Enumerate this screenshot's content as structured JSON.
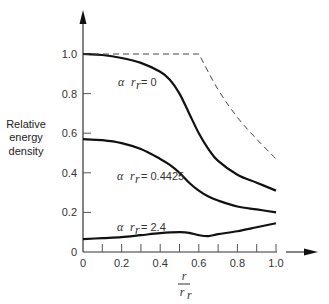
{
  "chart_data": {
    "type": "line",
    "title": "",
    "xlabel": "r / r_r",
    "ylabel": "Relative energy density",
    "xlim": [
      0,
      1.0
    ],
    "ylim": [
      0,
      1.0
    ],
    "grid": false,
    "legend": "inline curve labels",
    "x_ticks": [
      "0",
      "0.2",
      "0.4",
      "0.6",
      "0.8",
      "1.0"
    ],
    "y_ticks": [
      "0",
      "0.2",
      "0.4",
      "0.6",
      "0.8",
      "1.0"
    ],
    "x_minor_tick_step": 0.1,
    "series": [
      {
        "name": "α r_r = 0",
        "style": "solid",
        "x": [
          0,
          0.1,
          0.2,
          0.3,
          0.4,
          0.45,
          0.5,
          0.55,
          0.6,
          0.65,
          0.7,
          0.8,
          0.9,
          1.0
        ],
        "y": [
          1.0,
          0.995,
          0.98,
          0.955,
          0.91,
          0.87,
          0.8,
          0.7,
          0.6,
          0.52,
          0.46,
          0.39,
          0.35,
          0.31
        ]
      },
      {
        "name": "α r_r = 0.4425",
        "style": "solid",
        "x": [
          0,
          0.1,
          0.2,
          0.3,
          0.4,
          0.45,
          0.5,
          0.55,
          0.6,
          0.65,
          0.7,
          0.8,
          0.9,
          1.0
        ],
        "y": [
          0.57,
          0.565,
          0.55,
          0.52,
          0.47,
          0.44,
          0.4,
          0.35,
          0.31,
          0.28,
          0.26,
          0.23,
          0.215,
          0.2
        ]
      },
      {
        "name": "α r_r = 2.4",
        "style": "solid",
        "x": [
          0,
          0.1,
          0.2,
          0.3,
          0.4,
          0.5,
          0.55,
          0.6,
          0.65,
          0.7,
          0.8,
          0.9,
          1.0
        ],
        "y": [
          0.065,
          0.07,
          0.075,
          0.085,
          0.095,
          0.1,
          0.097,
          0.085,
          0.08,
          0.09,
          0.105,
          0.125,
          0.145
        ]
      },
      {
        "name": "limit",
        "style": "dashed",
        "x": [
          0,
          0.6,
          0.7,
          0.8,
          0.9,
          1.0
        ],
        "y": [
          1.0,
          1.0,
          0.82,
          0.68,
          0.57,
          0.47
        ]
      }
    ],
    "annotations": [
      "α r_r = 0",
      "α r_r = 0.4425",
      "α r_r = 2.4"
    ]
  },
  "labels": {
    "ylabel_lines": [
      "Relative",
      "energy",
      "density"
    ],
    "xlabel_num": "r",
    "xlabel_den": "r",
    "xlabel_den_sub": "r",
    "curve0": {
      "alpha": "α",
      "r": "r",
      "sub": "r",
      "eq": "= 0"
    },
    "curve1": {
      "alpha": "α",
      "r": "r",
      "sub": "r",
      "eq": "= 0.4425"
    },
    "curve2": {
      "alpha": "α",
      "r": "r",
      "sub": "r",
      "eq": "= 2.4"
    }
  }
}
